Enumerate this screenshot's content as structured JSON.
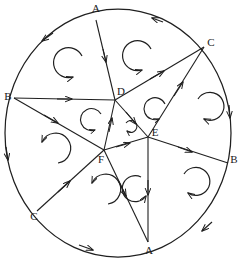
{
  "figure": {
    "kind": "hand-drawn geometry diagram",
    "stroke_color": "#1f1f1f",
    "background_color": "#ffffff",
    "width": 242,
    "height": 265
  },
  "circle": {
    "name": "outer-circle",
    "cx": 118,
    "cy": 133,
    "rx": 113,
    "ry": 124
  },
  "labels": [
    {
      "id": "A-top",
      "text": "A",
      "x": 96,
      "y": 9
    },
    {
      "id": "C-right-top",
      "text": "C",
      "x": 211,
      "y": 43
    },
    {
      "id": "B-left",
      "text": "B",
      "x": 8,
      "y": 97
    },
    {
      "id": "D-inner",
      "text": "D",
      "x": 121,
      "y": 92
    },
    {
      "id": "E-inner",
      "text": "E",
      "x": 155,
      "y": 133
    },
    {
      "id": "B-right",
      "text": "B",
      "x": 234,
      "y": 160
    },
    {
      "id": "F-inner",
      "text": "F",
      "x": 101,
      "y": 160
    },
    {
      "id": "C-left-bot",
      "text": "C",
      "x": 34,
      "y": 217
    },
    {
      "id": "A-bottom",
      "text": "A",
      "x": 149,
      "y": 251
    }
  ],
  "vertices": {
    "boundary": [
      {
        "id": "A-top",
        "x": 96,
        "y": 20
      },
      {
        "id": "C-right-top",
        "x": 204,
        "y": 47
      },
      {
        "id": "B-right",
        "x": 228,
        "y": 163
      },
      {
        "id": "A-bottom",
        "x": 148,
        "y": 242
      },
      {
        "id": "C-left-bot",
        "x": 37,
        "y": 211
      },
      {
        "id": "B-left",
        "x": 14,
        "y": 98
      }
    ],
    "inner": [
      {
        "id": "D",
        "x": 115,
        "y": 100
      },
      {
        "id": "E",
        "x": 148,
        "y": 137
      },
      {
        "id": "F",
        "x": 104,
        "y": 150
      }
    ]
  },
  "chords": [
    {
      "id": "chord-A-top-D",
      "from": "A-top",
      "to": "D",
      "direction": "A-top to D"
    },
    {
      "id": "chord-B-left-D",
      "from": "B-left",
      "to": "D",
      "direction": "B-left to D"
    },
    {
      "id": "chord-D-C-right-top",
      "from": "D",
      "to": "C-right-top",
      "direction": "D to C-right-top"
    },
    {
      "id": "chord-D-E",
      "from": "D",
      "to": "E",
      "direction": "D to E"
    },
    {
      "id": "chord-E-C-right-top",
      "from": "E",
      "to": "C-right-top",
      "direction": "E to C-right-top"
    },
    {
      "id": "chord-E-B-right",
      "from": "E",
      "to": "B-right",
      "direction": "E to B-right"
    },
    {
      "id": "chord-E-A-bottom",
      "from": "E",
      "to": "A-bottom",
      "direction": "E to A-bottom"
    },
    {
      "id": "chord-F-E",
      "from": "F",
      "to": "E",
      "direction": "F to E"
    },
    {
      "id": "chord-F-D",
      "from": "F",
      "to": "D",
      "direction": "F to D"
    },
    {
      "id": "chord-B-left-F",
      "from": "B-left",
      "to": "F",
      "direction": "B-left to F"
    },
    {
      "id": "chord-C-left-bot-F",
      "from": "C-left-bot",
      "to": "F",
      "direction": "C-left-bot to F"
    },
    {
      "id": "chord-F-A-bottom",
      "from": "F",
      "to": "A-bottom",
      "direction": "F to A-bottom"
    }
  ],
  "arc_arrows": [
    {
      "id": "arc-arrow-top-right",
      "position": "between A-top and C-right-top",
      "points": "counterclockwise"
    },
    {
      "id": "arc-arrow-top-left",
      "position": "between A-top and B-left",
      "points": "counterclockwise"
    },
    {
      "id": "arc-arrow-right",
      "position": "between C-right-top and B-right",
      "points": "clockwise"
    },
    {
      "id": "arc-arrow-left",
      "position": "between B-left and C-left-bot",
      "points": "clockwise"
    },
    {
      "id": "arc-arrow-bottom-right",
      "position": "between B-right and A-bottom",
      "points": "counterclockwise"
    },
    {
      "id": "arc-arrow-bottom-left",
      "position": "between C-left-bot and A-bottom",
      "points": "clockwise"
    }
  ],
  "rotation_arrows": [
    {
      "id": "rot-sector-top-left",
      "x": 70,
      "y": 62,
      "r": 15,
      "spin": "counterclockwise"
    },
    {
      "id": "rot-sector-top-right",
      "x": 139,
      "y": 55,
      "r": 15,
      "spin": "counterclockwise"
    },
    {
      "id": "rot-sector-right-upper",
      "x": 157,
      "y": 108,
      "r": 11,
      "spin": "counterclockwise"
    },
    {
      "id": "rot-sector-right-outer",
      "x": 192,
      "y": 110,
      "r": 14,
      "spin": "clockwise"
    },
    {
      "id": "rot-sector-center-small",
      "x": 123,
      "y": 128,
      "r": 6,
      "spin": "clockwise"
    },
    {
      "id": "rot-sector-mid-left",
      "x": 95,
      "y": 121,
      "r": 11,
      "spin": "counterclockwise"
    },
    {
      "id": "rot-sector-left-lower",
      "x": 48,
      "y": 155,
      "r": 15,
      "spin": "counterclockwise"
    },
    {
      "id": "rot-sector-bottom-left",
      "x": 98,
      "y": 196,
      "r": 15,
      "spin": "counterclockwise"
    },
    {
      "id": "rot-sector-bottom-mid",
      "x": 138,
      "y": 189,
      "r": 13,
      "spin": "clockwise"
    },
    {
      "id": "rot-sector-bottom-right",
      "x": 179,
      "y": 186,
      "r": 14,
      "spin": "clockwise"
    }
  ]
}
